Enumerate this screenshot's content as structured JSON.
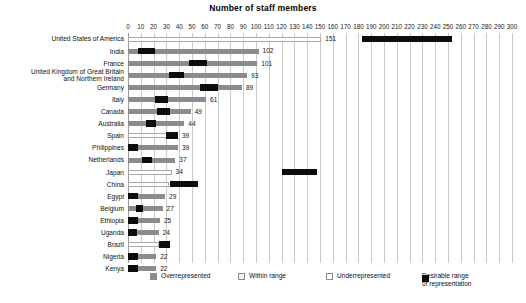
{
  "chart_data": {
    "type": "bar",
    "title": "Number of staff members",
    "xlabel": "",
    "ylabel": "",
    "xlim": [
      0,
      300
    ],
    "xtick_step": 10,
    "grid": true,
    "orientation": "horizontal",
    "legend_position": "bottom",
    "tick_labels": [
      "0",
      "10",
      "20",
      "30",
      "40",
      "50",
      "60",
      "70",
      "80",
      "90",
      "100",
      "110",
      "120",
      "130",
      "140",
      "150",
      "160",
      "170",
      "180",
      "190",
      "200",
      "210",
      "220",
      "230",
      "240",
      "250",
      "260",
      "270",
      "280",
      "290",
      "300"
    ],
    "categories": [
      "United States of America",
      "India",
      "France",
      "United Kingdom of Great Britain\nand Northern Ireland",
      "Germany",
      "Italy",
      "Canada",
      "Australia",
      "Spain",
      "Philippines",
      "Netherlands",
      "Japan",
      "China",
      "Egypt",
      "Belgium",
      "Ethiopia",
      "Uganda",
      "Brazil",
      "Nigeria",
      "Kenya"
    ],
    "values": [
      151,
      102,
      101,
      93,
      89,
      61,
      49,
      44,
      39,
      39,
      37,
      34,
      32,
      29,
      27,
      25,
      24,
      24,
      22,
      22
    ],
    "value_labels": [
      "151",
      "102",
      "101",
      "93",
      "89",
      "61",
      "49",
      "44",
      "39",
      "39",
      "37",
      "34",
      "32",
      "29",
      "27",
      "25",
      "24",
      "24",
      "22",
      "22"
    ],
    "status": [
      "underrepresented",
      "overrepresented",
      "overrepresented",
      "overrepresented",
      "overrepresented",
      "overrepresented",
      "overrepresented",
      "overrepresented",
      "underrepresented",
      "overrepresented",
      "overrepresented",
      "underrepresented",
      "underrepresented",
      "overrepresented",
      "overrepresented",
      "overrepresented",
      "overrepresented",
      "underrepresented",
      "overrepresented",
      "overrepresented"
    ],
    "desirable_range": [
      [
        183,
        253
      ],
      [
        8,
        21
      ],
      [
        48,
        62
      ],
      [
        32,
        44
      ],
      [
        56,
        70
      ],
      [
        21,
        31
      ],
      [
        23,
        33
      ],
      [
        14,
        22
      ],
      [
        30,
        39
      ],
      [
        0,
        8
      ],
      [
        11,
        19
      ],
      [
        120,
        148
      ],
      [
        33,
        55
      ],
      [
        0,
        8
      ],
      [
        6,
        12
      ],
      [
        0,
        8
      ],
      [
        0,
        7
      ],
      [
        24,
        33
      ],
      [
        0,
        8
      ],
      [
        0,
        8
      ]
    ],
    "series": [
      {
        "name": "Overrepresented",
        "color": "#8c8c8c"
      },
      {
        "name": "Within range",
        "color": "#f2f2f2"
      },
      {
        "name": "Underrepresented",
        "color": "#ffffff"
      },
      {
        "name": "Desirable range of representation",
        "color": "#0d0d0d"
      }
    ]
  },
  "legend": {
    "items": [
      {
        "label": "Overrepresented",
        "swatch": "over"
      },
      {
        "label": "Within range",
        "swatch": "within"
      },
      {
        "label": "Underrepresented",
        "swatch": "under"
      },
      {
        "label": "Desirable range\nof representation",
        "swatch": "range"
      }
    ]
  },
  "colors": {
    "overrepresented": "#8c8c8c",
    "within_range": "#f2f2f2",
    "underrepresented": "#ffffff",
    "desirable_range": "#0d0d0d",
    "gridline": "#c9c9c9",
    "text": "#111111",
    "background": "#ffffff"
  }
}
